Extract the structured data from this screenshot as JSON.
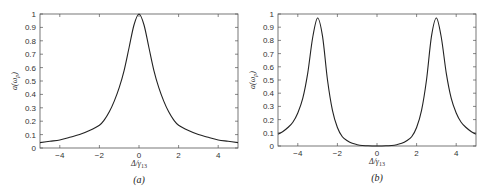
{
  "chart_data": [
    {
      "type": "line",
      "panel": "(a)",
      "caption": "(a)",
      "xlabel": "Δ/γ13",
      "ylabel": "a(ωp)",
      "xlim": [
        -5,
        5
      ],
      "ylim": [
        0,
        1
      ],
      "xticks": [
        -4,
        -2,
        0,
        2,
        4
      ],
      "yticks": [
        0,
        0.1,
        0.2,
        0.3,
        0.4,
        0.5,
        0.6,
        0.7,
        0.8,
        0.9,
        1
      ],
      "grid": false,
      "legend": null,
      "series": [
        {
          "name": "a(ωp)",
          "x": [
            -5,
            -4.5,
            -4,
            -3.5,
            -3,
            -2.5,
            -2,
            -1.75,
            -1.5,
            -1.25,
            -1,
            -0.75,
            -0.5,
            -0.25,
            0,
            0.25,
            0.5,
            0.75,
            1,
            1.25,
            1.5,
            1.75,
            2,
            2.5,
            3,
            3.5,
            4,
            4.5,
            5
          ],
          "y": [
            0.04,
            0.05,
            0.06,
            0.08,
            0.1,
            0.13,
            0.17,
            0.21,
            0.27,
            0.35,
            0.45,
            0.58,
            0.75,
            0.92,
            1.0,
            0.92,
            0.75,
            0.58,
            0.45,
            0.35,
            0.27,
            0.21,
            0.17,
            0.13,
            0.1,
            0.08,
            0.06,
            0.05,
            0.04
          ]
        }
      ]
    },
    {
      "type": "line",
      "panel": "(b)",
      "caption": "(b)",
      "xlabel": "Δ/γ13",
      "ylabel": "a(ωp)",
      "xlim": [
        -5,
        5
      ],
      "ylim": [
        0,
        1
      ],
      "xticks": [
        -4,
        -2,
        0,
        2,
        4
      ],
      "yticks": [
        0,
        0.1,
        0.2,
        0.3,
        0.4,
        0.5,
        0.6,
        0.7,
        0.8,
        0.9,
        1
      ],
      "grid": false,
      "legend": null,
      "series": [
        {
          "name": "a(ωp)",
          "x": [
            -5,
            -4.75,
            -4.5,
            -4.25,
            -4,
            -3.75,
            -3.5,
            -3.25,
            -3,
            -2.75,
            -2.5,
            -2.25,
            -2,
            -1.75,
            -1.5,
            -1.25,
            -1,
            -0.75,
            -0.5,
            -0.25,
            0,
            0.25,
            0.5,
            0.75,
            1,
            1.25,
            1.5,
            1.75,
            2,
            2.25,
            2.5,
            2.75,
            3,
            3.25,
            3.5,
            3.75,
            4,
            4.25,
            4.5,
            4.75,
            5
          ],
          "y": [
            0.09,
            0.11,
            0.14,
            0.18,
            0.25,
            0.36,
            0.55,
            0.82,
            0.97,
            0.83,
            0.5,
            0.27,
            0.14,
            0.07,
            0.04,
            0.02,
            0.01,
            0.004,
            0.002,
            0.0005,
            0.0,
            0.0005,
            0.002,
            0.004,
            0.01,
            0.02,
            0.04,
            0.07,
            0.14,
            0.27,
            0.5,
            0.83,
            0.97,
            0.82,
            0.55,
            0.36,
            0.25,
            0.18,
            0.14,
            0.11,
            0.09
          ]
        }
      ]
    }
  ],
  "panels": [
    {
      "caption": "(a)",
      "xlabel_main": "Δ/γ",
      "xlabel_sub": "13",
      "ylabel_main": "a(ω",
      "ylabel_sub": "p",
      "ylabel_close": ")",
      "xtick_labels": [
        "−4",
        "−2",
        "0",
        "2",
        "4"
      ],
      "ytick_labels": [
        "0",
        "0.1",
        "0.2",
        "0.3",
        "0.4",
        "0.5",
        "0.6",
        "0.7",
        "0.8",
        "0.9",
        "1"
      ]
    },
    {
      "caption": "(b)",
      "xlabel_main": "Δ/γ",
      "xlabel_sub": "13",
      "ylabel_main": "a(ω",
      "ylabel_sub": "p",
      "ylabel_close": ")",
      "xtick_labels": [
        "−4",
        "−2",
        "0",
        "2",
        "4"
      ],
      "ytick_labels": [
        "0",
        "0.1",
        "0.2",
        "0.3",
        "0.4",
        "0.5",
        "0.6",
        "0.7",
        "0.8",
        "0.9",
        "1"
      ]
    }
  ],
  "colors": {
    "line": "#222222",
    "axis": "#555555",
    "text": "#333333"
  }
}
